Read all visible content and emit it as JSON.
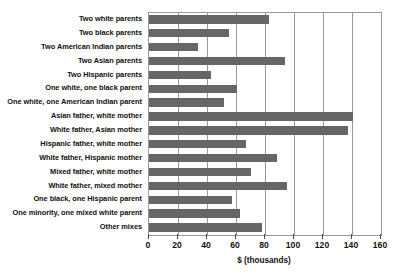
{
  "chart_data": {
    "type": "bar",
    "orientation": "horizontal",
    "title": "",
    "xlabel": "$ (thousands)",
    "ylabel": "",
    "xlim": [
      0,
      160
    ],
    "xticks": [
      0,
      20,
      40,
      60,
      80,
      100,
      120,
      140,
      160
    ],
    "grid": true,
    "grid_axis": "x",
    "legend": false,
    "bar_color": "#666666",
    "frame_color": "#9a9a9a",
    "categories": [
      "Two white parents",
      "Two black parents",
      "Two American Indian parents",
      "Two Asian parents",
      "Two Hispanic parents",
      "One white, one black parent",
      "One white, one American Indian parent",
      "Asian father, white mother",
      "White father, Asian mother",
      "Hispanic father, white mother",
      "White father, Hispanic mother",
      "Mixed father, white mother",
      "White father, mixed mother",
      "One black, one Hispanic parent",
      "One minority, one mixed white parent",
      "Other mixes"
    ],
    "values": [
      83,
      55,
      34,
      94,
      43,
      61,
      52,
      141,
      137,
      67,
      88,
      70,
      95,
      57,
      63,
      78
    ]
  }
}
